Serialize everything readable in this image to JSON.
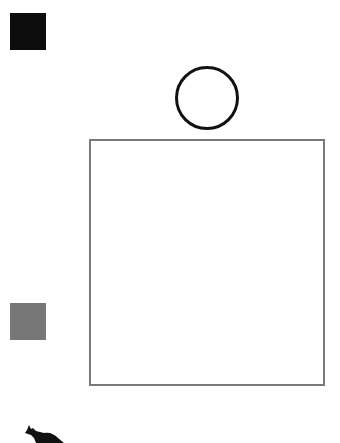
{
  "canvas": {
    "width": 340,
    "height": 443,
    "background": "#ffffff"
  },
  "shapes": [
    {
      "id": "black-square",
      "type": "square",
      "fill": "#0d0d0d",
      "x": 10,
      "y": 13,
      "w": 36,
      "h": 37
    },
    {
      "id": "circle",
      "type": "circle",
      "stroke": "#111111",
      "fill": "#ffffff",
      "cx": 207,
      "cy": 98,
      "r": 32
    },
    {
      "id": "big-rect",
      "type": "rectangle",
      "stroke": "#7a7a7a",
      "fill": "#ffffff",
      "x": 89,
      "y": 139,
      "w": 236,
      "h": 247
    },
    {
      "id": "gray-square",
      "type": "square",
      "fill": "#777777",
      "x": 10,
      "y": 303,
      "w": 36,
      "h": 37
    },
    {
      "id": "animal",
      "type": "silhouette",
      "fill": "#111111",
      "subject": "animal (kangaroo/cat)",
      "x": 24,
      "y": 422
    }
  ]
}
